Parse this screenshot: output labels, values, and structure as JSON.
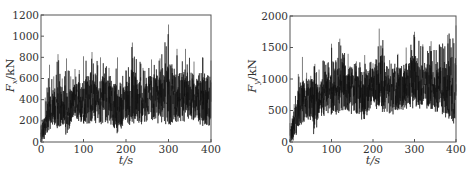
{
  "chart_data": [
    {
      "type": "line",
      "title": "",
      "xlabel": "t/s",
      "ylabel": "F_x/kN",
      "ylabel_main": "F",
      "ylabel_sub": "x",
      "ylabel_unit": "/kN",
      "xlim": [
        0,
        400
      ],
      "ylim": [
        0,
        1200
      ],
      "xticks": [
        "0",
        "100",
        "200",
        "300",
        "400"
      ],
      "yticks": [
        "0",
        "200",
        "400",
        "600",
        "800",
        "1000",
        "1200"
      ],
      "grid": false,
      "legend": "none",
      "series": [
        {
          "name": "F_x",
          "description": "noisy time series, rises from ~0 at t=0 to mean ~350-450 kN; peaks ~1100 kN near t=300",
          "x": [
            0,
            10,
            20,
            30,
            40,
            50,
            60,
            70,
            80,
            90,
            100,
            120,
            140,
            160,
            180,
            200,
            215,
            240,
            260,
            280,
            300,
            320,
            340,
            360,
            380,
            400
          ],
          "mean": [
            50,
            200,
            330,
            350,
            360,
            340,
            300,
            320,
            380,
            390,
            400,
            420,
            400,
            380,
            320,
            380,
            420,
            380,
            420,
            440,
            450,
            430,
            440,
            430,
            420,
            380
          ],
          "max": [
            150,
            420,
            730,
            620,
            830,
            600,
            790,
            620,
            690,
            680,
            810,
            850,
            800,
            700,
            800,
            680,
            940,
            700,
            780,
            790,
            1110,
            880,
            880,
            760,
            800,
            770
          ],
          "min": [
            0,
            0,
            150,
            150,
            160,
            120,
            70,
            150,
            160,
            170,
            190,
            190,
            180,
            160,
            140,
            180,
            180,
            150,
            190,
            170,
            220,
            230,
            220,
            190,
            130,
            150
          ]
        }
      ]
    },
    {
      "type": "line",
      "title": "",
      "xlabel": "t/s",
      "ylabel": "F_y/kN",
      "ylabel_main": "F",
      "ylabel_sub": "y",
      "ylabel_unit": "/kN",
      "xlim": [
        0,
        400
      ],
      "ylim": [
        0,
        2000
      ],
      "xticks": [
        "0",
        "100",
        "200",
        "300",
        "400"
      ],
      "yticks": [
        "0",
        "500",
        "1000",
        "1500",
        "2000"
      ],
      "grid": false,
      "legend": "none",
      "series": [
        {
          "name": "F_y",
          "description": "noisy time series, rises from ~0 at t=0 to mean ~800-950 kN; peaks ~1850 kN near t=395",
          "x": [
            0,
            10,
            20,
            30,
            40,
            50,
            60,
            70,
            80,
            90,
            100,
            120,
            140,
            160,
            180,
            200,
            215,
            240,
            260,
            280,
            300,
            320,
            340,
            360,
            380,
            400
          ],
          "mean": [
            100,
            300,
            550,
            650,
            700,
            650,
            600,
            650,
            750,
            800,
            850,
            900,
            850,
            800,
            750,
            900,
            950,
            800,
            850,
            900,
            950,
            900,
            900,
            850,
            850,
            800
          ],
          "max": [
            300,
            600,
            1080,
            1350,
            1100,
            1050,
            1240,
            1150,
            1300,
            1250,
            1560,
            1640,
            1400,
            1280,
            1380,
            1250,
            1800,
            1300,
            1400,
            1500,
            1750,
            1550,
            1600,
            1550,
            1700,
            1850
          ],
          "min": [
            0,
            0,
            200,
            300,
            250,
            150,
            100,
            250,
            350,
            380,
            400,
            420,
            400,
            380,
            330,
            450,
            500,
            380,
            480,
            500,
            550,
            600,
            550,
            450,
            400,
            350
          ]
        }
      ]
    }
  ]
}
